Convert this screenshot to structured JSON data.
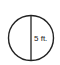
{
  "diagram": {
    "shape": "circle",
    "line": "diameter",
    "measurement_label": "5 ft.",
    "colors": {
      "stroke": "#222222",
      "background": "#ffffff"
    }
  }
}
